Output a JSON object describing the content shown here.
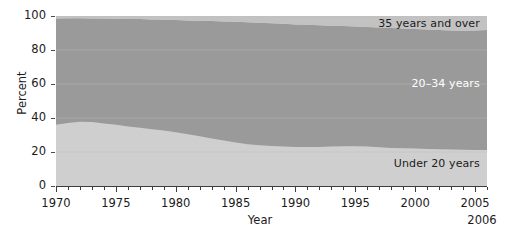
{
  "chart_data": {
    "type": "area",
    "stacked": true,
    "title": "",
    "xlabel": "Year",
    "ylabel": "Percent",
    "xlim": [
      1970,
      2006
    ],
    "ylim": [
      0,
      100
    ],
    "grid": true,
    "legend_position": "inline-right",
    "x_tick_labels": [
      "1970",
      "1975",
      "1980",
      "1985",
      "1990",
      "1995",
      "2000",
      "2005"
    ],
    "x_tick_values": [
      1970,
      1975,
      1980,
      1985,
      1990,
      1995,
      2000,
      2005
    ],
    "x_minor_tick_step": 1,
    "y_tick_labels": [
      "0",
      "20",
      "40",
      "60",
      "80",
      "100"
    ],
    "y_tick_values": [
      0,
      20,
      40,
      60,
      80,
      100
    ],
    "end_year_note": "2006",
    "x": [
      1970,
      1971,
      1972,
      1973,
      1974,
      1975,
      1976,
      1977,
      1978,
      1979,
      1980,
      1981,
      1982,
      1983,
      1984,
      1985,
      1986,
      1987,
      1988,
      1989,
      1990,
      1991,
      1992,
      1993,
      1994,
      1995,
      1996,
      1997,
      1998,
      1999,
      2000,
      2001,
      2002,
      2003,
      2004,
      2005,
      2006
    ],
    "series": [
      {
        "name": "Under 20 years",
        "color": "#cfcfcf",
        "label_color": "#1b1b1b",
        "values": [
          36.0,
          37.0,
          37.8,
          37.6,
          36.8,
          36.0,
          35.0,
          34.2,
          33.4,
          32.6,
          31.6,
          30.4,
          29.2,
          28.0,
          26.8,
          25.6,
          24.6,
          24.0,
          23.6,
          23.3,
          23.0,
          23.0,
          23.0,
          23.2,
          23.4,
          23.4,
          23.2,
          22.8,
          22.4,
          22.2,
          22.0,
          21.8,
          21.6,
          21.4,
          21.3,
          21.2,
          21.2
        ]
      },
      {
        "name": "20–34 years",
        "color": "#9a9a9a",
        "label_color": "#ffffff",
        "values": [
          62.6,
          61.7,
          60.9,
          61.0,
          61.7,
          62.4,
          63.3,
          64.0,
          64.6,
          65.2,
          66.0,
          67.0,
          68.0,
          69.0,
          70.0,
          71.0,
          71.7,
          72.0,
          72.1,
          72.1,
          72.0,
          71.8,
          71.5,
          71.1,
          70.7,
          70.4,
          70.3,
          70.4,
          70.5,
          70.4,
          70.3,
          70.2,
          70.1,
          70.0,
          70.0,
          70.3,
          70.6
        ]
      },
      {
        "name": "35 years and over",
        "color": "#c2c2c2",
        "label_color": "#1b1b1b",
        "values": [
          1.4,
          1.3,
          1.3,
          1.4,
          1.5,
          1.6,
          1.7,
          1.8,
          2.0,
          2.2,
          2.4,
          2.6,
          2.8,
          3.0,
          3.2,
          3.4,
          3.7,
          4.0,
          4.3,
          4.6,
          5.0,
          5.2,
          5.5,
          5.7,
          5.9,
          6.2,
          6.5,
          6.8,
          7.1,
          7.4,
          7.7,
          8.0,
          8.3,
          8.6,
          8.7,
          8.5,
          8.2
        ]
      }
    ]
  },
  "axes": {
    "y_title": "Percent",
    "x_title": "Year",
    "end_year": "2006"
  },
  "labels": {
    "top_band": "35 years and over",
    "middle_band": "20–34 years",
    "bottom_band": "Under 20 years"
  },
  "colors": {
    "background": "#ffffff",
    "band_under20": "#cfcfcf",
    "band_20_34": "#9a9a9a",
    "band_35plus": "#c2c2c2",
    "axis": "#3d3d3d",
    "text": "#1b1b1b",
    "gridline": "#bcbcbc"
  }
}
